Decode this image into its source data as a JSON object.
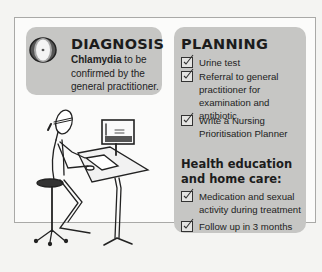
{
  "diagnosis": {
    "icon": "eye-target-icon",
    "title": "DIAGNOSIS",
    "condition": "Chlamydia",
    "body_rest": " to be confirmed by the general practitioner."
  },
  "planning": {
    "title": "PLANNING",
    "items": [
      {
        "label": "Urine test",
        "checked": true
      },
      {
        "label": "Referral to general practitioner for examination and antibiotic",
        "checked": true
      },
      {
        "label": "Write a Nursing Prioritisation Planner",
        "checked": true
      }
    ],
    "health_heading": "Health education and home care:",
    "health_items": [
      {
        "label": "Medication and sexual activity during treatment",
        "checked": true
      },
      {
        "label": "Follow up in 3 months",
        "checked": true
      }
    ]
  },
  "illustration": {
    "description": "nurse-at-standing-desk-illustration"
  },
  "colors": {
    "card_bg": "#c6c6c4",
    "frame_border": "#a9a9a7",
    "page_bg": "#f4f4f2"
  }
}
